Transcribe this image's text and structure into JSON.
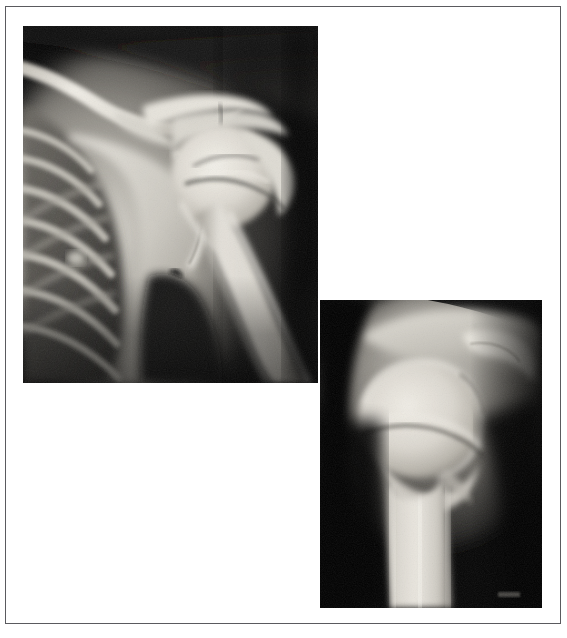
{
  "figure": {
    "type": "radiograph-figure",
    "panel_count": 2,
    "background_color": "#ffffff",
    "frame_color": "#5a5a5e",
    "panels": [
      {
        "id": "xray-ap",
        "name": "anteroposterior-shoulder-radiograph",
        "view_label": "AP shoulder view",
        "modality": "X-ray",
        "x": 23,
        "y": 26,
        "width": 295,
        "height": 357,
        "film_background_color": "#050505",
        "bone_highlight_color": "#e8e6df",
        "soft_tissue_color": "#7d7a74",
        "anatomy": [
          "clavicle",
          "acromion",
          "coracoid process",
          "scapula",
          "glenoid",
          "humeral head",
          "greater tuberosity",
          "proximal humeral shaft",
          "ribs",
          "lung field"
        ],
        "finding": "proximal humerus fracture at surgical neck"
      },
      {
        "id": "xray-lateral",
        "name": "lateral-shoulder-radiograph",
        "view_label": "Lateral / axillary shoulder view",
        "modality": "X-ray",
        "x": 320,
        "y": 300,
        "width": 222,
        "height": 308,
        "film_background_color": "#080808",
        "bone_highlight_color": "#ded9d0",
        "soft_tissue_color": "#6e6a64",
        "anatomy": [
          "humeral head",
          "glenoid",
          "acromion",
          "humeral shaft",
          "greater tuberosity"
        ],
        "finding": "impacted fracture line across humeral head"
      }
    ]
  }
}
